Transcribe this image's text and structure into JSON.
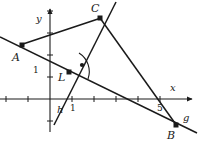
{
  "figure": {
    "width": 199,
    "height": 144,
    "background": "#ffffff",
    "stroke_color": "#1a1a1a"
  },
  "axes": {
    "x_label": "x",
    "y_label": "y",
    "origin_px": {
      "x": 50,
      "y": 99
    },
    "unit_px": 22,
    "x_axis": {
      "y_px": 99,
      "x_start_px": 0,
      "x_end_px": 194,
      "arrow": "right"
    },
    "y_axis": {
      "x_px": 50,
      "y_start_px": 132,
      "y_end_px": 7,
      "arrow": "up"
    },
    "x_ticks_px": [
      6,
      28,
      72,
      94,
      116,
      138,
      160
    ],
    "y_ticks_px": [
      11,
      33,
      55,
      77,
      121
    ],
    "tick_labels": [
      {
        "text": "1",
        "x": 70,
        "y": 106,
        "axis": "x"
      },
      {
        "text": "5",
        "x": 158,
        "y": 106,
        "axis": "x"
      },
      {
        "text": "1",
        "x": 33,
        "y": 67,
        "axis": "y"
      }
    ]
  },
  "points": [
    {
      "name": "A",
      "label": "A",
      "x_px": 22,
      "y_px": 45,
      "label_x": 13,
      "label_y": 51
    },
    {
      "name": "C",
      "label": "C",
      "x_px": 100,
      "y_px": 18,
      "label_x": 91,
      "label_y": 4
    },
    {
      "name": "L",
      "label": "L",
      "x_px": 69,
      "y_px": 72,
      "label_x": 59,
      "label_y": 73
    },
    {
      "name": "B",
      "label": "B",
      "x_px": 176,
      "y_px": 125,
      "label_x": 168,
      "label_y": 131
    }
  ],
  "lines": [
    {
      "name": "g",
      "label": "g",
      "label_x": 184,
      "label_y": 115,
      "x1": 0,
      "y1": 37,
      "x2": 196,
      "y2": 133
    },
    {
      "name": "h",
      "label": "h",
      "label_x": 58,
      "label_y": 106,
      "x1": 54,
      "y1": 124,
      "x2": 116,
      "y2": 2
    },
    {
      "name": "AC",
      "label": "",
      "x1": 22,
      "y1": 45,
      "x2": 100,
      "y2": 18
    },
    {
      "name": "CB",
      "label": "",
      "x1": 100,
      "y1": 18,
      "x2": 176,
      "y2": 125
    }
  ],
  "angle_marker": {
    "name": "right-angle-arc",
    "vertex_x": 69,
    "vertex_y": 72,
    "radius": 22,
    "dot_x": 82,
    "dot_y": 65,
    "dot_r": 2
  }
}
